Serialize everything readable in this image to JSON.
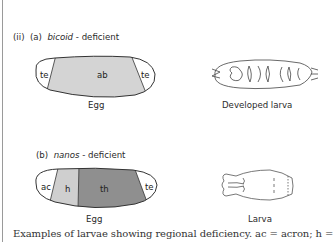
{
  "panel": {
    "roman": "(ii)",
    "a": {
      "letter": "(a)",
      "gene": "bicoid",
      "suffix": "- deficient",
      "egg": {
        "caption": "Egg",
        "segments": [
          {
            "label": "te",
            "color": "#ffffff"
          },
          {
            "label": "ab",
            "color": "#d4d4d4"
          },
          {
            "label": "te",
            "color": "#ffffff"
          }
        ]
      },
      "larva_caption": "Developed larva"
    },
    "b": {
      "letter": "(b)",
      "gene": "nanos",
      "suffix": "- deficient",
      "egg": {
        "caption": "Egg",
        "segments": [
          {
            "label": "ac",
            "color": "#ffffff"
          },
          {
            "label": "h",
            "color": "#cfcfcf"
          },
          {
            "label": "th",
            "color": "#8f8f8f"
          },
          {
            "label": "te",
            "color": "#ffffff"
          }
        ]
      },
      "larva_caption": "Larva"
    }
  },
  "caption": "Examples of larvae showing regional deficiency. ac = acron; h ="
}
